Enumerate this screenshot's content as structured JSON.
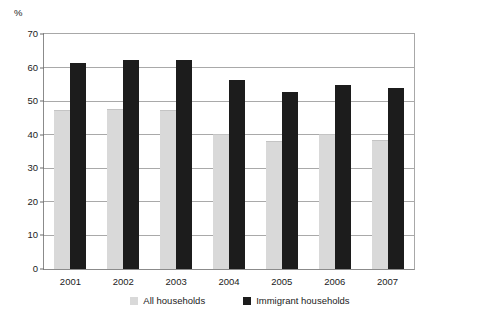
{
  "figure": {
    "top_crop_artifact": "",
    "y_axis_unit": "%"
  },
  "legend": {
    "entries": [
      {
        "label": "All households",
        "color": "#d9d9d9",
        "swatch_name": "legend-swatch-all-households"
      },
      {
        "label": "Immigrant households",
        "color": "#1c1c1c",
        "swatch_name": "legend-swatch-immigrant-households"
      }
    ]
  },
  "chart_data": {
    "type": "bar",
    "title": "",
    "xlabel": "",
    "ylabel": "%",
    "ylim": [
      0,
      70
    ],
    "yticks": [
      0,
      10,
      20,
      30,
      40,
      50,
      60,
      70
    ],
    "ytick_labels": [
      "0",
      "10",
      "20",
      "30",
      "40",
      "50",
      "60",
      "70"
    ],
    "grid": true,
    "legend_position": "bottom-center",
    "categories": [
      "2001",
      "2002",
      "2003",
      "2004",
      "2005",
      "2006",
      "2007"
    ],
    "series": [
      {
        "name": "All households",
        "color": "#d9d9d9",
        "values": [
          47.5,
          47.6,
          47.5,
          40.2,
          38.2,
          40.2,
          38.3
        ]
      },
      {
        "name": "Immigrant households",
        "color": "#1c1c1c",
        "values": [
          61.5,
          62.3,
          62.3,
          56.3,
          52.8,
          54.8,
          53.9
        ]
      }
    ]
  }
}
